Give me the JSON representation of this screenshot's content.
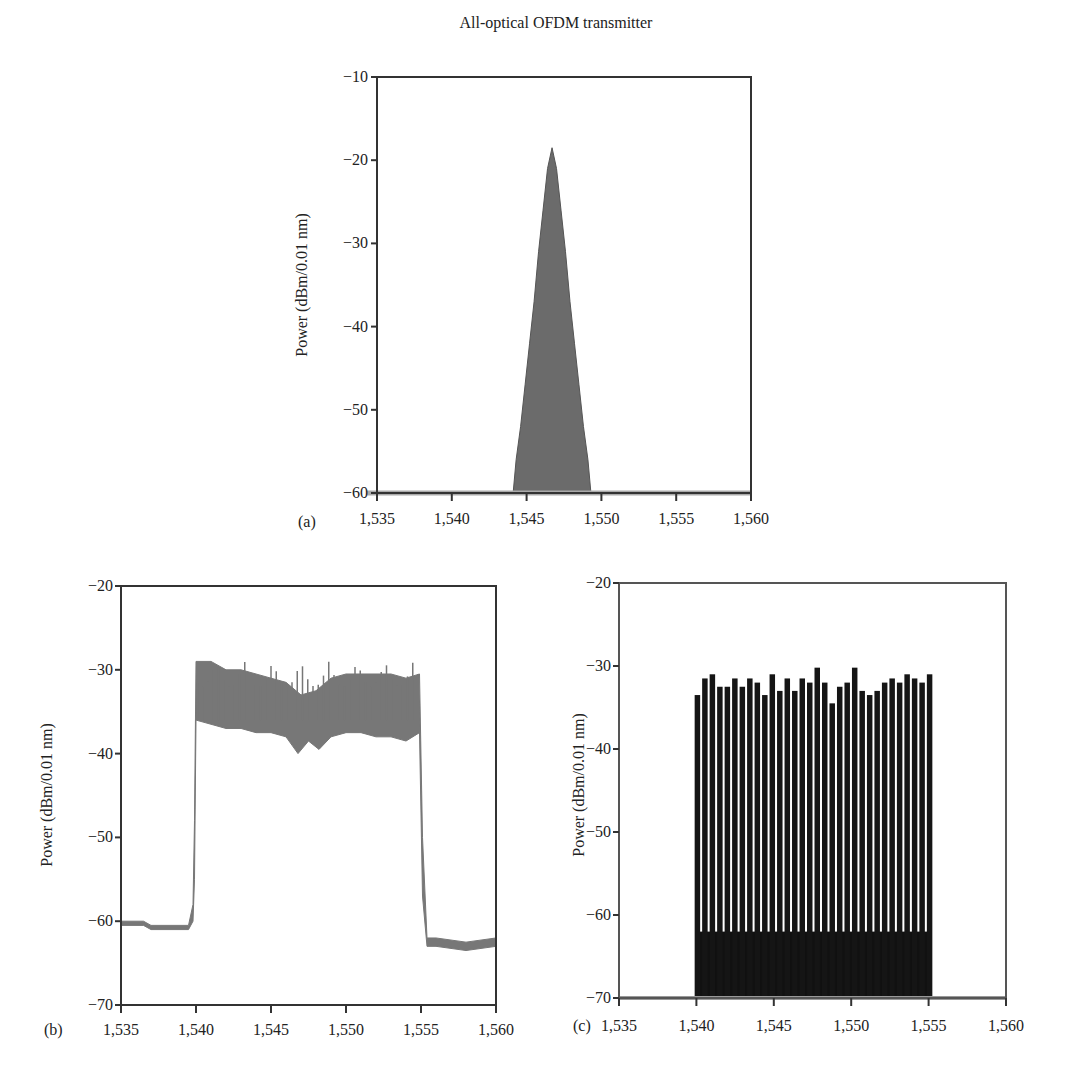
{
  "figure": {
    "panels": [
      "(a)",
      "(b)",
      "(c)"
    ]
  },
  "chart_data": [
    {
      "id": "a",
      "type": "area",
      "panel_label": "(a)",
      "title": "All-optical OFDM transmitter",
      "xlabel": "",
      "ylabel": "Power (dBm/0.01 nm)",
      "xlim": [
        1535,
        1560
      ],
      "ylim": [
        -60,
        -10
      ],
      "xticks": [
        "1,535",
        "1,540",
        "1,545",
        "1,550",
        "1,555",
        "1,560"
      ],
      "yticks": [
        "-10",
        "-20",
        "-30",
        "-40",
        "-50",
        "-60"
      ],
      "grid": false,
      "series": [
        {
          "name": "spectrum",
          "x": [
            1544.1,
            1544.3,
            1544.6,
            1544.9,
            1545.2,
            1545.5,
            1545.8,
            1546.1,
            1546.4,
            1546.7,
            1547.0,
            1547.3,
            1547.6,
            1547.9,
            1548.2,
            1548.5,
            1548.8,
            1549.1,
            1549.3
          ],
          "values": [
            -60,
            -56,
            -52,
            -47,
            -42,
            -37,
            -31,
            -26,
            -21,
            -18.5,
            -21,
            -26,
            -31,
            -37,
            -42,
            -47,
            -52,
            -56,
            -60
          ]
        }
      ]
    },
    {
      "id": "b",
      "type": "line",
      "panel_label": "(b)",
      "title": "",
      "xlabel": "",
      "ylabel": "Power (dBm/0.01 nm)",
      "xlim": [
        1535,
        1560
      ],
      "ylim": [
        -70,
        -20
      ],
      "xticks": [
        "1,535",
        "1,540",
        "1,545",
        "1,550",
        "1,555",
        "1,560"
      ],
      "yticks": [
        "-20",
        "-30",
        "-40",
        "-50",
        "-60",
        "-70"
      ],
      "grid": false,
      "series": [
        {
          "name": "spectrum_upper",
          "x": [
            1535,
            1536.5,
            1537,
            1539.5,
            1539.8,
            1539.9,
            1540,
            1541,
            1542,
            1543,
            1544,
            1545,
            1546,
            1547,
            1548,
            1549,
            1550,
            1551,
            1552,
            1553,
            1554,
            1554.9,
            1555.1,
            1555.4,
            1556,
            1558,
            1560
          ],
          "values": [
            -60,
            -60,
            -60.5,
            -60.5,
            -58,
            -48,
            -29,
            -29,
            -30,
            -30,
            -30.5,
            -31,
            -31.5,
            -33,
            -32.5,
            -31,
            -30.5,
            -30.5,
            -30.5,
            -30.5,
            -31,
            -30.5,
            -50,
            -62,
            -62,
            -62.5,
            -62
          ]
        },
        {
          "name": "spectrum_lower",
          "x": [
            1535,
            1536.5,
            1537,
            1539.5,
            1539.8,
            1539.9,
            1540,
            1541,
            1542,
            1543,
            1544,
            1545,
            1546,
            1546.8,
            1547.5,
            1548.2,
            1549,
            1550,
            1551,
            1552,
            1553,
            1554,
            1554.9,
            1555.1,
            1555.4,
            1556,
            1558,
            1560
          ],
          "values": [
            -60.5,
            -60.5,
            -61,
            -61,
            -60,
            -55,
            -36,
            -36.5,
            -37,
            -37,
            -37.5,
            -37.5,
            -38,
            -40,
            -38.5,
            -39.5,
            -38,
            -37.5,
            -37.5,
            -38,
            -38,
            -38.5,
            -37.5,
            -57,
            -63,
            -63,
            -63.5,
            -63
          ]
        }
      ]
    },
    {
      "id": "c",
      "type": "bar",
      "panel_label": "(c)",
      "title": "",
      "xlabel": "",
      "ylabel": "Power (dBm/0.01 nm)",
      "xlim": [
        1535,
        1560
      ],
      "ylim": [
        -70,
        -20
      ],
      "xticks": [
        "1,535",
        "1,540",
        "1,545",
        "1,550",
        "1,555",
        "1,560"
      ],
      "yticks": [
        "-20",
        "-30",
        "-40",
        "-50",
        "-60",
        "-70"
      ],
      "grid": false,
      "series": [
        {
          "name": "subcarrier_comb",
          "x_start": 1540,
          "x_end": 1555,
          "count": 32,
          "values": [
            -33.5,
            -31.5,
            -31,
            -32.5,
            -32.5,
            -31.5,
            -32.5,
            -31.5,
            -32,
            -33.5,
            -31,
            -33,
            -31.5,
            -33,
            -31.5,
            -32,
            -30.2,
            -32,
            -34.5,
            -32.5,
            -32,
            -30.2,
            -33,
            -33.5,
            -33,
            -32,
            -31.5,
            -32,
            -31,
            -31.5,
            -32,
            -31
          ]
        }
      ],
      "noise_floor": -70
    }
  ]
}
